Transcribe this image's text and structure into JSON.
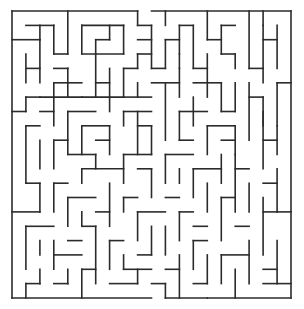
{
  "maze": {
    "cols": 20,
    "rows": 20,
    "origin": [
      12,
      11
    ],
    "cell": [
      13.95,
      14.35
    ],
    "wall_color": "#2b2b2b",
    "entrance": {
      "side": "top",
      "col": 9
    },
    "exit": {
      "side": "bottom",
      "col": 10
    },
    "walls": [
      [
        0,
        0,
        9,
        0
      ],
      [
        10,
        0,
        20,
        0
      ],
      [
        0,
        0,
        0,
        20
      ],
      [
        20,
        0,
        20,
        20
      ],
      [
        0,
        20,
        10,
        20
      ],
      [
        11,
        20,
        20,
        20
      ],
      [
        1,
        1,
        3,
        1
      ],
      [
        3,
        1,
        3,
        3
      ],
      [
        2,
        1,
        2,
        2
      ],
      [
        4,
        0,
        4,
        3
      ],
      [
        3,
        3,
        4,
        3
      ],
      [
        5,
        1,
        8,
        1
      ],
      [
        5,
        1,
        5,
        3
      ],
      [
        6,
        2,
        7,
        2
      ],
      [
        7,
        1,
        7,
        2
      ],
      [
        8,
        1,
        8,
        3
      ],
      [
        5,
        3,
        8,
        3
      ],
      [
        6,
        2,
        6,
        3
      ],
      [
        9,
        1,
        10,
        1
      ],
      [
        9,
        0,
        9,
        1
      ],
      [
        9,
        2,
        10,
        2
      ],
      [
        9,
        3,
        10,
        3
      ],
      [
        11,
        0,
        11,
        1
      ],
      [
        11,
        2,
        11,
        4
      ],
      [
        10,
        1,
        10,
        4
      ],
      [
        11,
        2,
        12,
        2
      ],
      [
        12,
        1,
        13,
        1
      ],
      [
        12,
        1,
        12,
        3
      ],
      [
        13,
        1,
        13,
        4
      ],
      [
        12,
        3,
        12,
        4
      ],
      [
        14,
        0,
        14,
        2
      ],
      [
        14,
        2,
        15,
        2
      ],
      [
        15,
        1,
        16,
        1
      ],
      [
        15,
        1,
        15,
        3
      ],
      [
        15,
        3,
        16,
        3
      ],
      [
        16,
        3,
        16,
        4
      ],
      [
        17,
        0,
        17,
        4
      ],
      [
        17,
        4,
        18,
        4
      ],
      [
        18,
        0,
        18,
        1
      ],
      [
        18,
        2,
        19,
        2
      ],
      [
        18,
        1,
        18,
        5
      ],
      [
        19,
        1,
        19,
        4
      ],
      [
        0,
        2,
        2,
        2
      ],
      [
        2,
        2,
        2,
        5
      ],
      [
        1,
        4,
        2,
        4
      ],
      [
        1,
        3,
        1,
        5
      ],
      [
        3,
        4,
        4,
        4
      ],
      [
        4,
        4,
        4,
        6
      ],
      [
        3,
        5,
        5,
        5
      ],
      [
        3,
        5,
        3,
        6
      ],
      [
        2,
        6,
        5,
        6
      ],
      [
        6,
        3,
        6,
        6
      ],
      [
        6,
        5,
        7,
        5
      ],
      [
        7,
        4,
        7,
        6
      ],
      [
        5,
        6,
        8,
        6
      ],
      [
        7,
        6,
        7,
        7
      ],
      [
        8,
        4,
        9,
        4
      ],
      [
        8,
        4,
        8,
        6
      ],
      [
        9,
        5,
        9,
        6
      ],
      [
        8,
        6,
        10,
        6
      ],
      [
        9,
        3,
        9,
        4
      ],
      [
        10,
        4,
        11,
        4
      ],
      [
        10,
        5,
        12,
        5
      ],
      [
        11,
        5,
        11,
        9
      ],
      [
        12,
        4,
        12,
        6
      ],
      [
        13,
        5,
        15,
        5
      ],
      [
        14,
        3,
        14,
        6
      ],
      [
        13,
        4,
        14,
        4
      ],
      [
        13,
        6,
        13,
        8
      ],
      [
        15,
        5,
        15,
        7
      ],
      [
        16,
        5,
        16,
        7
      ],
      [
        15,
        7,
        16,
        7
      ],
      [
        17,
        5,
        17,
        9
      ],
      [
        18,
        6,
        18,
        8
      ],
      [
        17,
        6,
        18,
        6
      ],
      [
        19,
        5,
        20,
        5
      ],
      [
        19,
        5,
        19,
        8
      ],
      [
        0,
        7,
        1,
        7
      ],
      [
        1,
        6,
        2,
        6
      ],
      [
        1,
        6,
        1,
        7
      ],
      [
        2,
        7,
        3,
        7
      ],
      [
        3,
        6,
        3,
        8
      ],
      [
        4,
        7,
        4,
        10
      ],
      [
        4,
        7,
        6,
        7
      ],
      [
        5,
        8,
        5,
        10
      ],
      [
        5,
        8,
        7,
        8
      ],
      [
        7,
        8,
        7,
        10
      ],
      [
        6,
        9,
        7,
        9
      ],
      [
        8,
        7,
        8,
        8
      ],
      [
        8,
        7,
        10,
        7
      ],
      [
        9,
        8,
        10,
        8
      ],
      [
        9,
        7,
        9,
        10
      ],
      [
        10,
        8,
        10,
        10
      ],
      [
        12,
        7,
        14,
        7
      ],
      [
        12,
        7,
        12,
        9
      ],
      [
        12,
        9,
        13,
        9
      ],
      [
        14,
        8,
        16,
        8
      ],
      [
        14,
        8,
        14,
        10
      ],
      [
        16,
        8,
        16,
        10
      ],
      [
        15,
        9,
        16,
        9
      ],
      [
        18,
        7,
        18,
        11
      ],
      [
        18,
        9,
        19,
        9
      ],
      [
        19,
        8,
        19,
        10
      ],
      [
        1,
        8,
        2,
        8
      ],
      [
        1,
        8,
        1,
        12
      ],
      [
        2,
        9,
        2,
        11
      ],
      [
        3,
        9,
        4,
        9
      ],
      [
        3,
        9,
        3,
        11
      ],
      [
        4,
        10,
        6,
        10
      ],
      [
        5,
        11,
        5,
        12
      ],
      [
        5,
        11,
        8,
        11
      ],
      [
        6,
        10,
        6,
        11
      ],
      [
        8,
        10,
        8,
        12
      ],
      [
        8,
        10,
        10,
        10
      ],
      [
        9,
        11,
        10,
        11
      ],
      [
        10,
        11,
        10,
        13
      ],
      [
        11,
        10,
        11,
        12
      ],
      [
        11,
        10,
        13,
        10
      ],
      [
        12,
        11,
        12,
        12
      ],
      [
        13,
        11,
        13,
        13
      ],
      [
        13,
        11,
        15,
        11
      ],
      [
        14,
        12,
        14,
        14
      ],
      [
        15,
        10,
        15,
        12
      ],
      [
        16,
        11,
        17,
        11
      ],
      [
        16,
        10,
        16,
        14
      ],
      [
        17,
        12,
        17,
        14
      ],
      [
        19,
        11,
        19,
        14
      ],
      [
        18,
        12,
        19,
        12
      ],
      [
        0,
        14,
        2,
        14
      ],
      [
        1,
        12,
        2,
        12
      ],
      [
        2,
        12,
        2,
        14
      ],
      [
        3,
        12,
        3,
        14
      ],
      [
        3,
        12,
        4,
        12
      ],
      [
        4,
        13,
        4,
        15
      ],
      [
        4,
        13,
        6,
        13
      ],
      [
        5,
        14,
        5,
        15
      ],
      [
        6,
        14,
        7,
        14
      ],
      [
        7,
        12,
        7,
        15
      ],
      [
        8,
        13,
        8,
        14
      ],
      [
        8,
        13,
        9,
        13
      ],
      [
        9,
        14,
        9,
        16
      ],
      [
        9,
        14,
        11,
        14
      ],
      [
        11,
        13,
        12,
        13
      ],
      [
        11,
        15,
        11,
        17
      ],
      [
        12,
        14,
        12,
        16
      ],
      [
        12,
        14,
        13,
        14
      ],
      [
        13,
        15,
        14,
        15
      ],
      [
        15,
        13,
        15,
        16
      ],
      [
        15,
        13,
        16,
        13
      ],
      [
        16,
        15,
        17,
        15
      ],
      [
        18,
        13,
        18,
        17
      ],
      [
        18,
        14,
        20,
        14
      ],
      [
        1,
        15,
        1,
        18
      ],
      [
        1,
        15,
        3,
        15
      ],
      [
        2,
        16,
        2,
        17
      ],
      [
        3,
        16,
        3,
        18
      ],
      [
        3,
        17,
        5,
        17
      ],
      [
        4,
        16,
        5,
        16
      ],
      [
        5,
        15,
        6,
        15
      ],
      [
        6,
        15,
        6,
        19
      ],
      [
        7,
        16,
        7,
        18
      ],
      [
        7,
        16,
        8,
        16
      ],
      [
        8,
        17,
        8,
        18
      ],
      [
        8,
        18,
        10,
        18
      ],
      [
        9,
        17,
        10,
        17
      ],
      [
        10,
        15,
        10,
        17
      ],
      [
        11,
        18,
        12,
        18
      ],
      [
        12,
        17,
        12,
        20
      ],
      [
        13,
        16,
        13,
        18
      ],
      [
        13,
        16,
        14,
        16
      ],
      [
        14,
        17,
        14,
        19
      ],
      [
        15,
        17,
        17,
        17
      ],
      [
        15,
        17,
        15,
        19
      ],
      [
        16,
        18,
        16,
        20
      ],
      [
        17,
        16,
        17,
        19
      ],
      [
        18,
        18,
        19,
        18
      ],
      [
        19,
        16,
        19,
        19
      ],
      [
        18,
        19,
        20,
        19
      ],
      [
        1,
        19,
        1,
        20
      ],
      [
        1,
        19,
        2,
        19
      ],
      [
        2,
        18,
        2,
        19
      ],
      [
        3,
        19,
        4,
        19
      ],
      [
        4,
        18,
        4,
        19
      ],
      [
        5,
        18,
        5,
        20
      ],
      [
        5,
        18,
        6,
        18
      ],
      [
        7,
        19,
        9,
        19
      ],
      [
        9,
        18,
        9,
        19
      ],
      [
        10,
        19,
        11,
        19
      ],
      [
        11,
        19,
        11,
        20
      ],
      [
        13,
        19,
        14,
        19
      ],
      [
        14,
        20,
        14,
        20
      ]
    ]
  }
}
